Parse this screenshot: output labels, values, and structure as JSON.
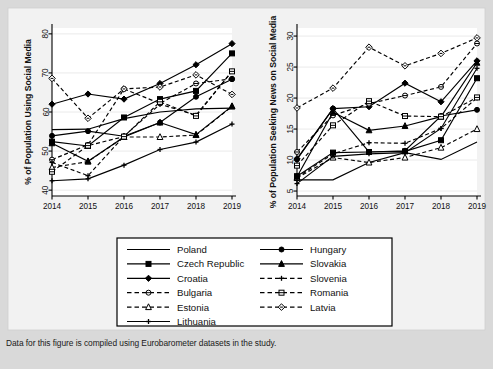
{
  "caption": "Data for this figure is compiled using Eurobarometer datasets in the study.",
  "legend": {
    "columns": [
      [
        "Poland",
        "Czech Republic",
        "Croatia",
        "Bulgaria",
        "Estonia",
        "Lithuania"
      ],
      [
        "Hungary",
        "Slovakia",
        "Slovenia",
        "Romania",
        "Latvia"
      ]
    ]
  },
  "series_style": {
    "Poland": {
      "dash": "solid",
      "marker": "none"
    },
    "Czech Republic": {
      "dash": "solid",
      "marker": "filled-square"
    },
    "Croatia": {
      "dash": "solid",
      "marker": "filled-diamond"
    },
    "Bulgaria": {
      "dash": "dashed",
      "marker": "open-circle"
    },
    "Estonia": {
      "dash": "dashed",
      "marker": "open-triangle"
    },
    "Lithuania": {
      "dash": "solid",
      "marker": "plus"
    },
    "Hungary": {
      "dash": "solid",
      "marker": "filled-circle"
    },
    "Slovakia": {
      "dash": "solid",
      "marker": "filled-triangle"
    },
    "Slovenia": {
      "dash": "dashed",
      "marker": "plus"
    },
    "Romania": {
      "dash": "dashed",
      "marker": "open-square"
    },
    "Latvia": {
      "dash": "dashed",
      "marker": "open-diamond"
    }
  },
  "chart_data": [
    {
      "type": "line",
      "panel": "left",
      "title": "",
      "xlabel": "",
      "ylabel": "% of Population Using Social Media",
      "x": [
        2014,
        2015,
        2016,
        2017,
        2018,
        2019
      ],
      "xticklabels": [
        "2014",
        "2015",
        "2016",
        "2017",
        "2018",
        "2019"
      ],
      "ylim": [
        38.5,
        81.5
      ],
      "yticks": [
        40,
        50,
        60,
        70,
        80
      ],
      "grid": true,
      "legend_position": "below",
      "series": [
        {
          "name": "Poland",
          "values": [
            55.5,
            55.6,
            58.3,
            60.0,
            60.8,
            61.0
          ]
        },
        {
          "name": "Czech Republic",
          "values": [
            52.4,
            51.3,
            58.6,
            63.3,
            65.4,
            75.0
          ]
        },
        {
          "name": "Croatia",
          "values": [
            62.0,
            64.6,
            63.3,
            67.3,
            72.1,
            77.5
          ]
        },
        {
          "name": "Bulgaria",
          "values": [
            47.8,
            51.6,
            65.9,
            62.2,
            67.3,
            68.5
          ]
        },
        {
          "name": "Estonia",
          "values": [
            45.8,
            47.3,
            53.6,
            53.6,
            54.1,
            61.4
          ]
        },
        {
          "name": "Lithuania",
          "values": [
            42.4,
            42.9,
            46.4,
            50.4,
            52.3,
            56.9
          ]
        },
        {
          "name": "Hungary",
          "values": [
            53.9,
            55.1,
            53.8,
            57.3,
            63.9,
            68.4
          ]
        },
        {
          "name": "Slovakia",
          "values": [
            52.0,
            47.4,
            53.6,
            57.3,
            54.2,
            61.5
          ]
        },
        {
          "name": "Slovenia",
          "values": [
            47.1,
            43.7,
            53.8,
            62.0,
            59.2,
            70.4
          ]
        },
        {
          "name": "Romania",
          "values": [
            44.7,
            51.4,
            53.7,
            62.6,
            59.0,
            70.4
          ]
        },
        {
          "name": "Latvia",
          "values": [
            68.6,
            58.4,
            65.9,
            66.4,
            69.5,
            64.5
          ]
        }
      ]
    },
    {
      "type": "line",
      "panel": "right",
      "title": "",
      "xlabel": "",
      "ylabel": "% of Population Seeking News on Social Media",
      "x": [
        2014,
        2015,
        2016,
        2017,
        2018,
        2019
      ],
      "xticklabels": [
        "2014",
        "2015",
        "2016",
        "2017",
        "2018",
        "2019"
      ],
      "ylim": [
        4.2,
        31.3
      ],
      "yticks": [
        5,
        10,
        15,
        20,
        25,
        30
      ],
      "grid": true,
      "legend_position": "below",
      "series": [
        {
          "name": "Poland",
          "values": [
            6.8,
            6.8,
            9.6,
            11.2,
            10.1,
            12.9
          ]
        },
        {
          "name": "Czech Republic",
          "values": [
            7.4,
            11.2,
            11.3,
            11.4,
            13.2,
            23.2
          ]
        },
        {
          "name": "Croatia",
          "values": [
            10.2,
            18.3,
            18.6,
            22.4,
            19.4,
            26.0
          ]
        },
        {
          "name": "Bulgaria",
          "values": [
            11.3,
            17.2,
            19.1,
            20.4,
            21.8,
            28.8
          ]
        },
        {
          "name": "Estonia",
          "values": [
            7.1,
            10.4,
            9.6,
            10.4,
            12.0,
            15.0
          ]
        },
        {
          "name": "Lithuania",
          "values": [
            6.2,
            10.6,
            11.0,
            11.2,
            15.1,
            24.8
          ]
        },
        {
          "name": "Hungary",
          "values": [
            10.1,
            18.3,
            11.3,
            11.5,
            17.1,
            18.1
          ]
        },
        {
          "name": "Slovakia",
          "values": [
            7.3,
            17.7,
            14.8,
            15.5,
            17.0,
            25.7
          ]
        },
        {
          "name": "Slovenia",
          "values": [
            7.2,
            11.0,
            12.8,
            12.7,
            15.1,
            20.0
          ]
        },
        {
          "name": "Romania",
          "values": [
            9.1,
            15.6,
            19.5,
            17.1,
            17.0,
            20.1
          ]
        },
        {
          "name": "Latvia",
          "values": [
            18.4,
            21.6,
            28.2,
            25.2,
            27.2,
            29.7
          ]
        }
      ]
    }
  ]
}
